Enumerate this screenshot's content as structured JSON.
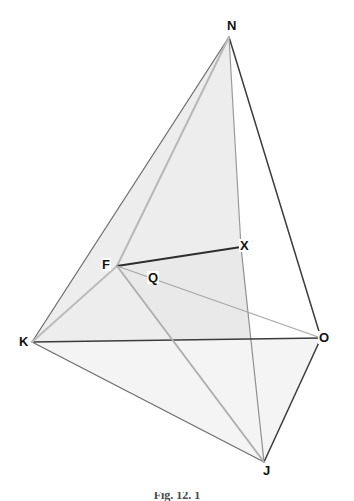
{
  "figure": {
    "kind": "geometry-diagram",
    "background_color": "#ffffff",
    "face_fill_color": "#ededed",
    "face_fill_color_light": "#f1f1f1",
    "edge_color_dark": "#3c3c3c",
    "edge_color_mid": "#808080",
    "edge_color_light": "#b4b4b4",
    "label_color": "#131313"
  },
  "caption": {
    "text": "Fig. 12. 1"
  },
  "points": {
    "N": {
      "label": "N",
      "x": 229,
      "y": 37,
      "label_x": 226,
      "label_y": 19
    },
    "K": {
      "label": "K",
      "x": 32,
      "y": 342,
      "label_x": 18,
      "label_y": 335
    },
    "O": {
      "label": "O",
      "x": 321,
      "y": 338,
      "label_x": 318,
      "label_y": 331
    },
    "J": {
      "label": "J",
      "x": 264,
      "y": 462,
      "label_x": 262,
      "label_y": 464
    },
    "F": {
      "label": "F",
      "x": 117,
      "y": 266,
      "label_x": 101,
      "label_y": 258
    },
    "X": {
      "label": "X",
      "x": 241,
      "y": 247,
      "label_x": 239,
      "label_y": 239
    },
    "Q": {
      "label": "Q",
      "x": 153,
      "y": 282,
      "label_x": 147,
      "label_y": 271
    }
  },
  "faces": [
    {
      "name": "face-n-k-f-x",
      "vertices": "229,37 32,342 117,266 241,247",
      "fill": "#ededed"
    },
    {
      "name": "face-k-f-j",
      "vertices": "32,342 117,266 264,462",
      "fill": "#ededed"
    },
    {
      "name": "face-f-x-j",
      "vertices": "117,266 241,247 264,462",
      "fill": "#e9e9e9"
    },
    {
      "name": "face-k-j-o-base",
      "vertices": "32,342 264,462 321,338",
      "fill": "#f4f4f4"
    }
  ],
  "edges": [
    {
      "name": "edge-n-k",
      "from": "N",
      "to": "K",
      "color": "#707070",
      "width": 1.3
    },
    {
      "name": "edge-n-o",
      "from": "N",
      "to": "O",
      "color": "#3c3c3c",
      "width": 1.5
    },
    {
      "name": "edge-n-x",
      "from": "N",
      "to": "X",
      "color": "#9a9a9a",
      "width": 1.2
    },
    {
      "name": "edge-x-j",
      "from": "X",
      "to": "J",
      "color": "#8f8f8f",
      "width": 1.2
    },
    {
      "name": "edge-k-o",
      "from": "K",
      "to": "O",
      "color": "#3c3c3c",
      "width": 1.5
    },
    {
      "name": "edge-k-j",
      "from": "K",
      "to": "J",
      "color": "#6e6e6e",
      "width": 1.3
    },
    {
      "name": "edge-j-o",
      "from": "J",
      "to": "O",
      "color": "#3c3c3c",
      "width": 1.5
    },
    {
      "name": "edge-k-f",
      "from": "K",
      "to": "F",
      "color": "#bcbcbc",
      "width": 2.0
    },
    {
      "name": "edge-f-n",
      "from": "F",
      "to": "N",
      "color": "#b8b8b8",
      "width": 2.0
    },
    {
      "name": "edge-f-x",
      "from": "F",
      "to": "X",
      "color": "#2e2e2e",
      "width": 1.8
    },
    {
      "name": "edge-f-o",
      "from": "F",
      "to": "O",
      "color": "#a6a6a6",
      "width": 1.2
    },
    {
      "name": "edge-f-j",
      "from": "F",
      "to": "J",
      "color": "#b0b0b0",
      "width": 2.0
    }
  ]
}
